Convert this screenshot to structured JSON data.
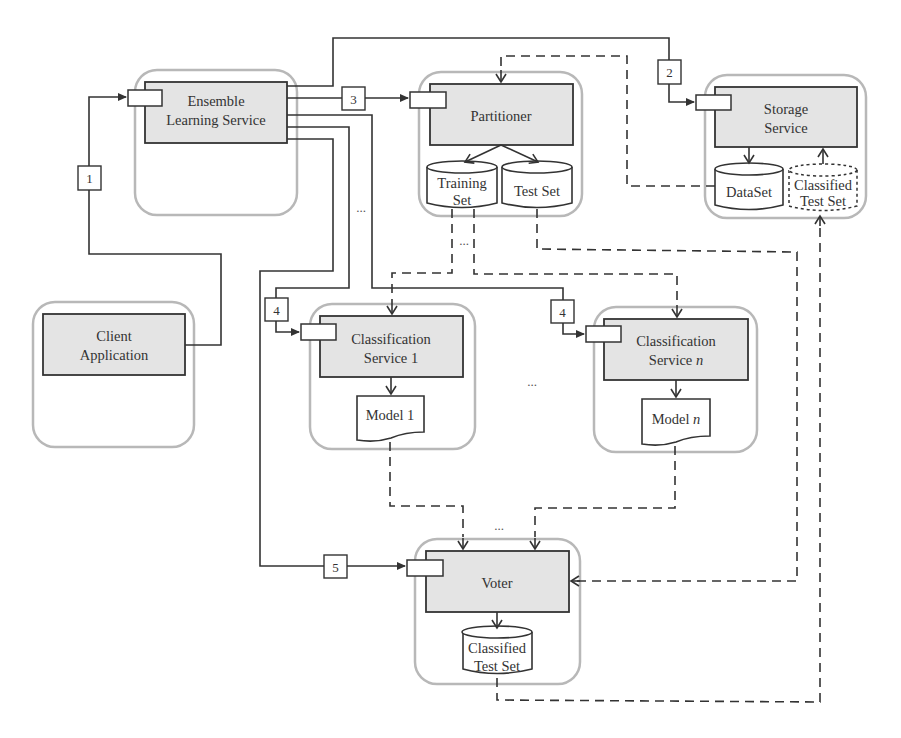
{
  "diagram": {
    "nodes": {
      "ensemble": {
        "line1": "Ensemble",
        "line2": "Learning Service"
      },
      "partitioner": {
        "label": "Partitioner"
      },
      "storage": {
        "line1": "Storage",
        "line2": "Service"
      },
      "client": {
        "line1": "Client",
        "line2": "Application"
      },
      "classifier1": {
        "line1": "Classification",
        "line2": "Service 1"
      },
      "classifierN": {
        "line1": "Classification",
        "line2_prefix": "Service ",
        "line2_italic": "n"
      },
      "voter": {
        "label": "Voter"
      }
    },
    "data_stores": {
      "training_set": {
        "line1": "Training",
        "line2": "Set"
      },
      "test_set": {
        "label": "Test Set"
      },
      "dataset": {
        "label": "DataSet"
      },
      "storage_classified": {
        "line1": "Classified",
        "line2": "Test Set"
      },
      "voter_classified": {
        "line1": "Classified",
        "line2": "Test Set"
      }
    },
    "documents": {
      "model1": {
        "label": "Model 1"
      },
      "modelN": {
        "prefix": "Model ",
        "italic": "n"
      }
    },
    "steps": [
      "1",
      "2",
      "3",
      "4",
      "4",
      "5"
    ],
    "ellipses": {
      "ensemble_lines": "...",
      "training_outputs": "...",
      "classifiers_between": "...",
      "voter_inputs": "..."
    }
  }
}
